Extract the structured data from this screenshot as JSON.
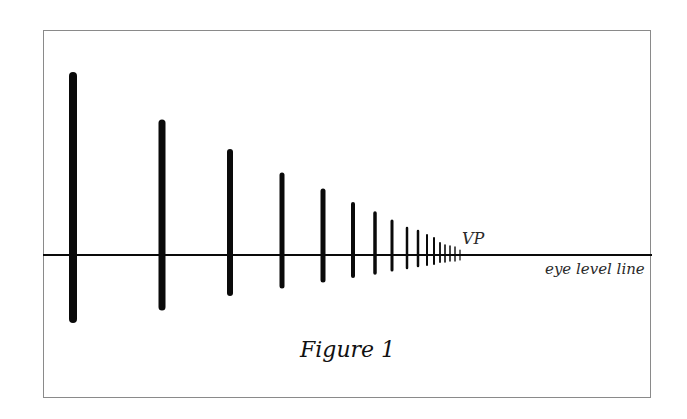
{
  "figure": {
    "caption": "Figure 1",
    "vanishing_point_label": "VP",
    "horizon_label": "eye level line",
    "ink_color": "#0a0a0a",
    "frame_color": "#8a8a8a",
    "horizon": {
      "y": 255,
      "x_start": 43,
      "x_end": 652,
      "stroke_width": 2
    },
    "vanishing_point": {
      "x": 462,
      "y": 255
    },
    "posts": [
      {
        "x": 73,
        "top": 76,
        "bottom": 319,
        "width": 8
      },
      {
        "x": 162,
        "top": 123,
        "bottom": 307,
        "width": 7
      },
      {
        "x": 230,
        "top": 152,
        "bottom": 293,
        "width": 6
      },
      {
        "x": 282,
        "top": 175,
        "bottom": 286,
        "width": 5
      },
      {
        "x": 323,
        "top": 191,
        "bottom": 280,
        "width": 5
      },
      {
        "x": 353,
        "top": 204,
        "bottom": 276,
        "width": 4
      },
      {
        "x": 375,
        "top": 213,
        "bottom": 273,
        "width": 3.5
      },
      {
        "x": 392,
        "top": 221,
        "bottom": 270,
        "width": 3
      },
      {
        "x": 407,
        "top": 228,
        "bottom": 268,
        "width": 2.5
      },
      {
        "x": 418,
        "top": 231,
        "bottom": 266,
        "width": 2.5
      },
      {
        "x": 427,
        "top": 235,
        "bottom": 265,
        "width": 2
      },
      {
        "x": 434,
        "top": 238,
        "bottom": 264,
        "width": 2
      },
      {
        "x": 440,
        "top": 243,
        "bottom": 262,
        "width": 1.8
      },
      {
        "x": 445,
        "top": 245,
        "bottom": 262,
        "width": 1.6
      },
      {
        "x": 450,
        "top": 246,
        "bottom": 261,
        "width": 1.5
      },
      {
        "x": 455,
        "top": 247,
        "bottom": 261,
        "width": 1.4
      },
      {
        "x": 460,
        "top": 250,
        "bottom": 260,
        "width": 1.2
      }
    ]
  }
}
